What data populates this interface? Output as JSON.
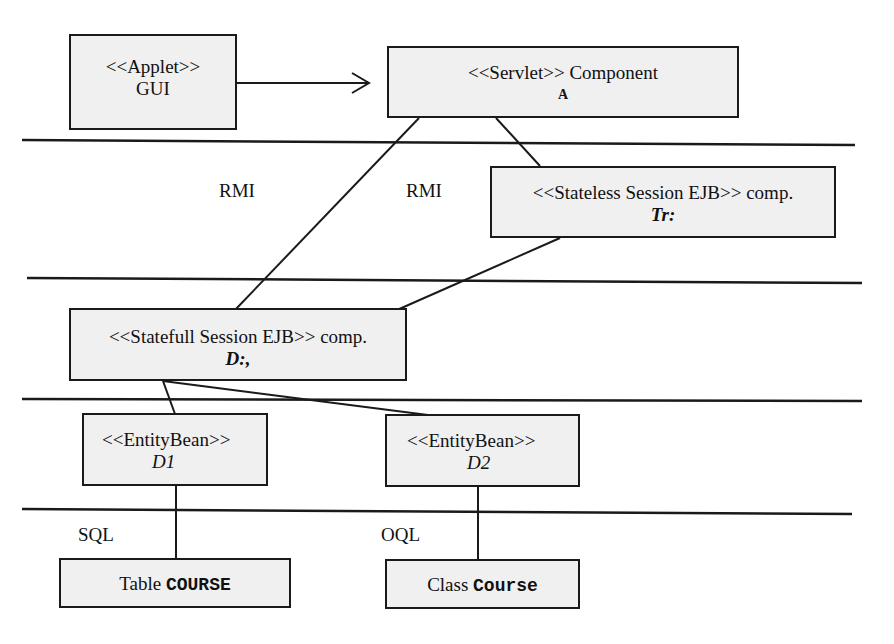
{
  "diagram": {
    "colors": {
      "box_fill": "#f0f0f0",
      "stroke": "#1a1a1a",
      "text": "#111111",
      "background": "#ffffff"
    },
    "nodes": {
      "applet": {
        "stereotype": "<<Applet>>",
        "name": "GUI"
      },
      "servlet": {
        "stereotype": "<<Servlet>>",
        "name": "Component",
        "tag": "A"
      },
      "stateless": {
        "stereotype": "<<Stateless Session EJB>>",
        "name": "comp.",
        "tag": "Tr:"
      },
      "statefull": {
        "stereotype": "<<Statefull Session EJB>>",
        "name": "comp.",
        "tag": "D:,"
      },
      "entity1": {
        "stereotype": "<<EntityBean>>",
        "tag": "D1"
      },
      "entity2": {
        "stereotype": "<<EntityBean>>",
        "tag": "D2"
      },
      "table_course": {
        "prefix": "Table",
        "name": "COURSE"
      },
      "class_course": {
        "prefix": "Class",
        "name": "Course"
      }
    },
    "labels": {
      "rmi_left": "RMI",
      "rmi_right": "RMI",
      "sql": "SQL",
      "oql": "OQL"
    },
    "edges": [
      {
        "from": "applet",
        "to": "servlet",
        "type": "arrow"
      },
      {
        "from": "servlet",
        "to": "statefull",
        "type": "line",
        "label": "RMI"
      },
      {
        "from": "servlet",
        "to": "stateless",
        "type": "line",
        "label": "RMI"
      },
      {
        "from": "stateless",
        "to": "statefull",
        "type": "line"
      },
      {
        "from": "statefull",
        "to": "entity1",
        "type": "line"
      },
      {
        "from": "statefull",
        "to": "entity2",
        "type": "line"
      },
      {
        "from": "entity1",
        "to": "table_course",
        "type": "line",
        "label": "SQL"
      },
      {
        "from": "entity2",
        "to": "class_course",
        "type": "line",
        "label": "OQL"
      }
    ],
    "tier_separators": 4
  }
}
